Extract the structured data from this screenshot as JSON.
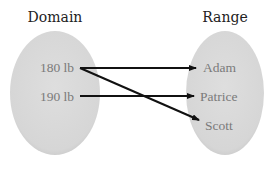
{
  "diagram": {
    "type": "mapping",
    "domain_title": "Domain",
    "range_title": "Range",
    "domain": [
      "180 lb",
      "190 lb"
    ],
    "range": [
      "Adam",
      "Patrice",
      "Scott"
    ],
    "mappings": [
      {
        "from": "180 lb",
        "to": "Adam"
      },
      {
        "from": "180 lb",
        "to": "Scott"
      },
      {
        "from": "190 lb",
        "to": "Patrice"
      }
    ],
    "colors": {
      "ellipse_fill": "#d9d9d9",
      "arrow": "#111111",
      "label": "#7a7a7a",
      "title": "#222222"
    }
  }
}
